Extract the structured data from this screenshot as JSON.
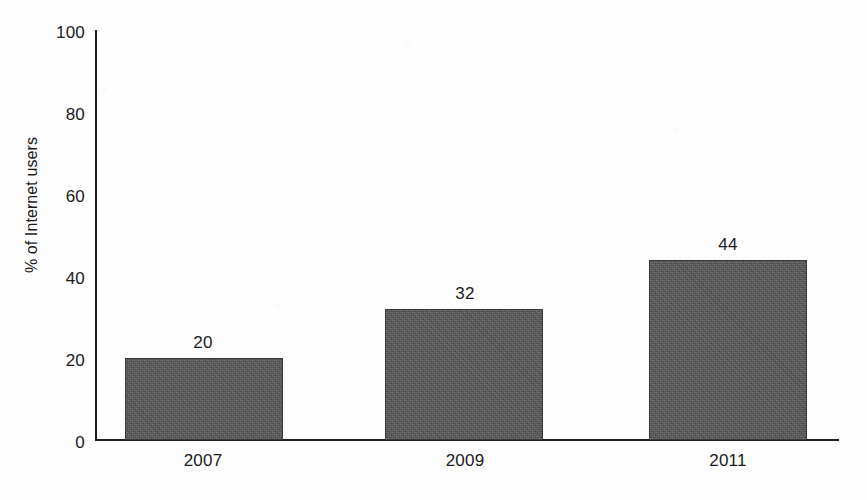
{
  "chart_data": {
    "type": "bar",
    "title": "",
    "xlabel": "",
    "ylabel": "% of Internet users",
    "categories": [
      "2007",
      "2009",
      "2011"
    ],
    "values": [
      20,
      32,
      44
    ],
    "value_labels": [
      "20",
      "32",
      "44"
    ],
    "ylim": [
      0,
      100
    ],
    "y_ticks": [
      0,
      20,
      40,
      60,
      80,
      100
    ],
    "y_tick_labels": [
      "0",
      "20",
      "40",
      "60",
      "80",
      "100"
    ],
    "grid": false,
    "legend": false,
    "legend_position": "none",
    "series": [
      {
        "name": "% of Internet users",
        "values": [
          20,
          32,
          44
        ],
        "color": "#565656"
      }
    ]
  },
  "axes": {
    "y_title": "% of Internet users",
    "y_tick_labels": [
      "100",
      "80",
      "60",
      "40",
      "20",
      "0"
    ],
    "x_tick_labels": [
      "2007",
      "2009",
      "2011"
    ]
  },
  "bars": [
    {
      "category": "2007",
      "value_label": "20"
    },
    {
      "category": "2009",
      "value_label": "32"
    },
    {
      "category": "2011",
      "value_label": "44"
    }
  ],
  "colors": {
    "bar_fill": "#565656",
    "bar_stroke": "#3a3a3a",
    "axis": "#1d1d1d",
    "text": "#1b1b1b",
    "background": "#fdfdfd"
  }
}
